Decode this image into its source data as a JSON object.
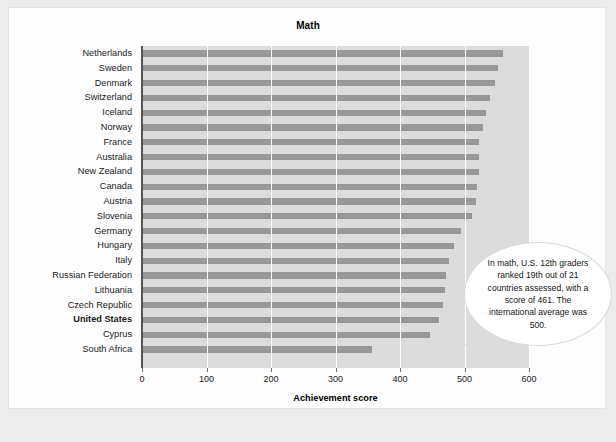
{
  "chart_data": {
    "type": "bar",
    "orientation": "horizontal",
    "title": "Math",
    "xlabel": "Achievement score",
    "ylabel": "",
    "xlim": [
      0,
      600
    ],
    "xticks": [
      0,
      100,
      200,
      300,
      400,
      500,
      600
    ],
    "grid": true,
    "legend": null,
    "highlight_category": "United States",
    "categories": [
      "Netherlands",
      "Sweden",
      "Denmark",
      "Switzerland",
      "Iceland",
      "Norway",
      "France",
      "Australia",
      "New Zealand",
      "Canada",
      "Austria",
      "Slovenia",
      "Germany",
      "Hungary",
      "Italy",
      "Russian Federation",
      "Lithuania",
      "Czech Republic",
      "United States",
      "Cyprus",
      "South Africa"
    ],
    "values": [
      560,
      552,
      547,
      540,
      534,
      528,
      523,
      522,
      522,
      519,
      518,
      512,
      495,
      483,
      476,
      471,
      469,
      466,
      461,
      446,
      356
    ],
    "annotations": [
      {
        "text": "In math, U.S. 12th graders ranked 19th out of 21 countries assessed, with a score of 461. The international average was 500.",
        "attached_to": "United States"
      }
    ]
  },
  "colors": {
    "bar": "#989898",
    "plot_background": "#dcdcdc",
    "gridline": "#ffffff",
    "page_background": "#ececed",
    "card_background": "#fdfdfd"
  }
}
